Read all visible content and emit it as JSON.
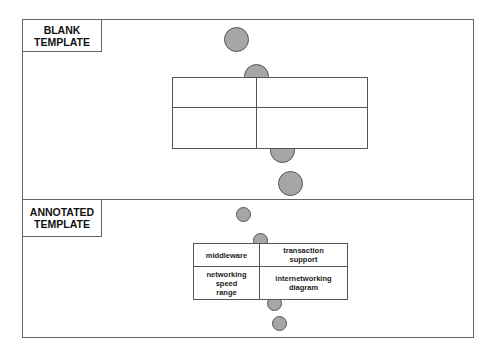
{
  "panels": [
    {
      "label": "BLANK\nTEMPLATE",
      "label_lines": [
        "BLANK",
        "TEMPLATE"
      ],
      "table": {
        "cells": [
          {
            "row": 0,
            "col": 0,
            "text": ""
          },
          {
            "row": 0,
            "col": 1,
            "text": ""
          },
          {
            "row": 1,
            "col": 0,
            "text": ""
          },
          {
            "row": 1,
            "col": 1,
            "text": ""
          }
        ]
      }
    },
    {
      "label": "ANNOTATED\nTEMPLATE",
      "label_lines": [
        "ANNOTATED",
        "TEMPLATE"
      ],
      "table": {
        "cells": [
          {
            "row": 0,
            "col": 0,
            "lines": [
              "middleware"
            ]
          },
          {
            "row": 0,
            "col": 1,
            "lines": [
              "transaction",
              "support"
            ]
          },
          {
            "row": 1,
            "col": 0,
            "lines": [
              "networking",
              "speed",
              "range"
            ]
          },
          {
            "row": 1,
            "col": 1,
            "lines": [
              "internetworking",
              "diagram"
            ]
          }
        ]
      }
    }
  ],
  "colors": {
    "circle_fill": "#a6a6a6",
    "circle_stroke": "#555555",
    "line": "#666666"
  }
}
